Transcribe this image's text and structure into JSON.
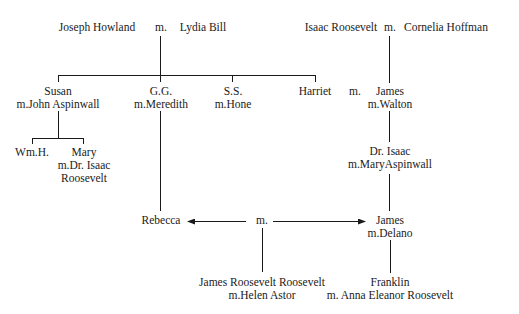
{
  "diagram": {
    "type": "family-tree",
    "generation_1": {
      "left_couple": {
        "husband": "Joseph Howland",
        "marriage": "m.",
        "wife": "Lydia Bill"
      },
      "right_couple": {
        "husband": "Isaac Roosevelt",
        "marriage": "m.",
        "wife": "Cornelia Hoffman"
      }
    },
    "generation_2": {
      "susan": {
        "name": "Susan",
        "spouse": "m.John Aspinwall"
      },
      "gg": {
        "name": "G.G.",
        "spouse": "m.Meredith"
      },
      "ss": {
        "name": "S.S.",
        "spouse": "m.Hone"
      },
      "harriet": {
        "name": "Harriet"
      },
      "harriet_marriage": "m.",
      "james": {
        "name": "James",
        "spouse": "m.Walton"
      }
    },
    "generation_3": {
      "wmh": {
        "name": "Wm.H."
      },
      "mary": {
        "name": "Mary",
        "spouse_line1": "m.Dr. Isaac",
        "spouse_line2": "Roosevelt"
      },
      "dr_isaac": {
        "name": "Dr. Isaac",
        "spouse": "m.MaryAspinwall"
      }
    },
    "generation_4": {
      "rebecca": {
        "name": "Rebecca"
      },
      "marriage": "m.",
      "james_delano": {
        "name": "James",
        "spouse": "m.Delano"
      }
    },
    "generation_5": {
      "james_rr": {
        "name": "James Roosevelt Roosevelt",
        "spouse": "m.Helen Astor"
      },
      "franklin": {
        "name": "Franklin",
        "spouse": "m. Anna Eleanor Roosevelt"
      }
    },
    "colors": {
      "line": "#1a1a1a",
      "text": "#1a1a1a",
      "background": "#ffffff"
    }
  }
}
